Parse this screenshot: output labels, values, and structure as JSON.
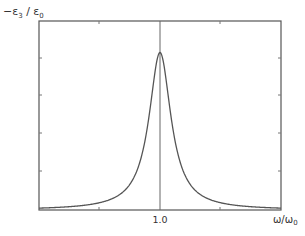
{
  "chart_data": {
    "type": "line",
    "title": "",
    "xlabel": "ω/ω",
    "xlabel_sub": "0",
    "ylabel": "−ε",
    "ylabel_sub3": "3",
    "ylabel_rest": " / ε",
    "ylabel_sub0": "0",
    "x_ticks": [
      {
        "value": 1.0,
        "label": "1.0"
      }
    ],
    "y_ticks": [],
    "xlim": [
      0.5,
      1.5
    ],
    "ylim": [
      0,
      1.2
    ],
    "grid": false,
    "legend": null,
    "vertical_line": {
      "x": 1.0
    },
    "series": [
      {
        "name": "Lorentzian resonance",
        "color": "#555555",
        "x": [
          0.5,
          0.6,
          0.7,
          0.8,
          0.85,
          0.9,
          0.93,
          0.95,
          0.97,
          0.99,
          1.0,
          1.01,
          1.03,
          1.05,
          1.07,
          1.1,
          1.15,
          1.2,
          1.3,
          1.4,
          1.5
        ],
        "y": [
          0.01,
          0.02,
          0.04,
          0.09,
          0.15,
          0.29,
          0.45,
          0.6,
          0.79,
          0.97,
          1.0,
          0.97,
          0.79,
          0.6,
          0.45,
          0.29,
          0.15,
          0.09,
          0.04,
          0.03,
          0.02
        ]
      }
    ]
  }
}
